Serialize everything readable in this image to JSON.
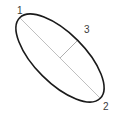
{
  "figure": {
    "type": "geometry-diagram",
    "shape": "ellipse",
    "background_color": "#ffffff",
    "width": 117,
    "height": 117
  },
  "labels": {
    "vertex_1": "1",
    "vertex_2": "2",
    "semi_minor": "3"
  },
  "colors": {
    "outline": "#1a1a1a",
    "major_axis": "#b0b0b0",
    "minor_axis": "#9a9a9a",
    "text": "#3b3b3b"
  },
  "geometry": {
    "center": {
      "x": 60,
      "y": 58
    },
    "semi_major": 57,
    "semi_minor": 25,
    "rotation_deg": 45,
    "major_axis_endpoints": [
      {
        "x": 20,
        "y": 18
      },
      {
        "x": 100,
        "y": 98
      }
    ],
    "minor_axis_segment": [
      {
        "x": 60,
        "y": 58
      },
      {
        "x": 78,
        "y": 40
      }
    ],
    "outline_stroke_width": 1.6,
    "axis_stroke_width": 0.8
  }
}
